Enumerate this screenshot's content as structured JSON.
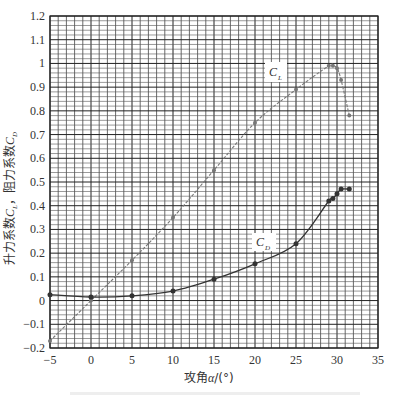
{
  "chart_data": {
    "type": "line",
    "title": "",
    "xlabel": "攻角α/(°)",
    "ylabel": "升力系数C_L，阻力系数C_D",
    "xlim": [
      -5,
      35
    ],
    "ylim": [
      -0.2,
      1.2
    ],
    "x_ticks": [
      "-5",
      "0",
      "5",
      "10",
      "15",
      "20",
      "25",
      "30",
      "35"
    ],
    "y_ticks": [
      "-0.2",
      "-0.1",
      "0",
      "0.1",
      "0.2",
      "0.3",
      "0.4",
      "0.5",
      "0.6",
      "0.7",
      "0.8",
      "0.9",
      "1",
      "1.1",
      "1.2"
    ],
    "grid": true,
    "legend": "inline labels",
    "series": [
      {
        "name": "C_L",
        "label": "C",
        "subscript": "L",
        "color": "#777777",
        "x": [
          -5,
          0,
          5,
          10,
          15,
          20,
          25,
          29,
          29.5,
          30,
          30.5,
          31.5
        ],
        "values": [
          -0.17,
          0.0,
          0.17,
          0.35,
          0.55,
          0.75,
          0.89,
          0.99,
          0.99,
          0.98,
          0.93,
          0.78
        ]
      },
      {
        "name": "C_D",
        "label": "C",
        "subscript": "D",
        "color": "#333333",
        "x": [
          -5,
          0,
          5,
          10,
          15,
          20,
          25,
          29,
          29.5,
          30,
          30.5,
          31.5
        ],
        "values": [
          0.025,
          0.015,
          0.02,
          0.04,
          0.09,
          0.155,
          0.24,
          0.42,
          0.43,
          0.45,
          0.47,
          0.47
        ]
      }
    ]
  },
  "labels": {
    "xlabel_prefix": "攻角",
    "xlabel_var": "α",
    "xlabel_unit": "/(°)",
    "ylabel_part1": "升力系数",
    "ylabel_var1": "C",
    "ylabel_sub1": "L",
    "ylabel_sep": "，阻力系数",
    "ylabel_var2": "C",
    "ylabel_sub2": "D"
  }
}
